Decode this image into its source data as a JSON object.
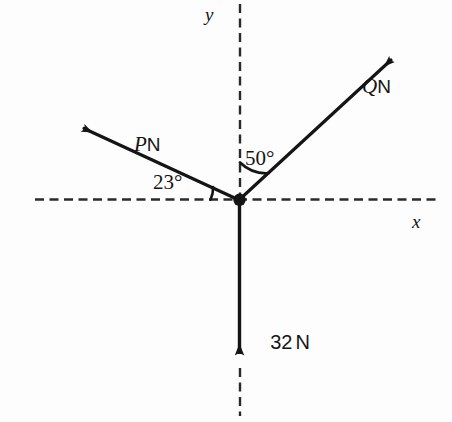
{
  "figure": {
    "type": "free-body-force-diagram",
    "background_color": "#fdfdfd",
    "stroke_color": "#151515",
    "axes": {
      "x_label": "x",
      "y_label": "y",
      "origin": {
        "x": 239,
        "y": 200
      },
      "style": "dashed"
    },
    "vectors": [
      {
        "id": "P",
        "label_symbol": "P",
        "label_unit": "N",
        "label_text": "PN",
        "direction_deg_from_positive_x": 155,
        "angle_from_negative_x_axis_deg": 23,
        "tip": {
          "x": 76,
          "y": 125
        }
      },
      {
        "id": "Q",
        "label_symbol": "Q",
        "label_unit": "N",
        "label_text": "QN",
        "direction_deg_from_positive_x": 43,
        "angle_from_positive_y_axis_deg": 50,
        "tip": {
          "x": 399,
          "y": 53
        }
      },
      {
        "id": "W",
        "label_symbol": "32",
        "label_unit": "N",
        "label_text": "32N",
        "direction_deg_from_positive_x": 270,
        "magnitude": 32,
        "tip": {
          "x": 239,
          "y": 364
        }
      }
    ],
    "angles": [
      {
        "id": "angle-23",
        "value_text": "23°",
        "degrees": 23,
        "between": [
          "negative-x-axis",
          "P"
        ]
      },
      {
        "id": "angle-50",
        "value_text": "50°",
        "degrees": 50,
        "between": [
          "positive-y-axis",
          "Q"
        ]
      }
    ]
  }
}
